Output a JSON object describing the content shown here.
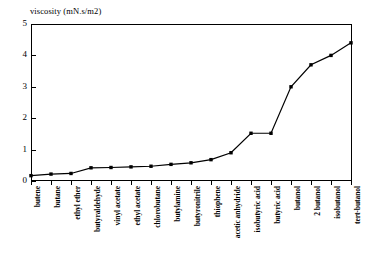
{
  "chart_data": {
    "type": "line",
    "title": "",
    "ylabel": "viscosity (mN.s/m2)",
    "xlabel": "",
    "ylim": [
      0,
      5
    ],
    "yticks": [
      0,
      1,
      2,
      3,
      4,
      5
    ],
    "ytick_labels": [
      "0",
      "1",
      "2",
      "3",
      "4",
      "5"
    ],
    "grid": false,
    "legend": false,
    "marker": "square",
    "line_color": "#000000",
    "marker_color": "#000000",
    "categories": [
      "butene",
      "butane",
      "ethyl ether",
      "butyraldehyde",
      "vinyl acetate",
      "ethyl acetate",
      "chlorobutane",
      "butylamine",
      "butyronitrile",
      "thiophene",
      "acetic anhydride",
      "isobutyric acid",
      "butyric acid",
      "butanol",
      "2 butanol",
      "isobutanol",
      "tert-butanol"
    ],
    "values": [
      0.17,
      0.22,
      0.24,
      0.42,
      0.43,
      0.45,
      0.47,
      0.53,
      0.58,
      0.68,
      0.9,
      1.52,
      1.52,
      3.0,
      3.7,
      4.0,
      4.4
    ]
  }
}
